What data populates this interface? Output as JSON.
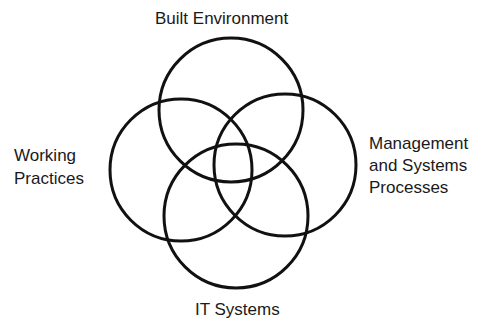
{
  "diagram": {
    "title": "",
    "stroke_color": "#111111",
    "background": "#ffffff",
    "circles": [
      {
        "id": "built-environment",
        "label_lines": [
          "Built Environment"
        ],
        "cx": 231,
        "cy": 110,
        "r": 72
      },
      {
        "id": "working-practices",
        "label_lines": [
          "Working",
          "Practices"
        ],
        "cx": 181,
        "cy": 170,
        "r": 71
      },
      {
        "id": "management-systems-processes",
        "label_lines": [
          "Management",
          "and Systems",
          "Processes"
        ],
        "cx": 285,
        "cy": 165,
        "r": 71
      },
      {
        "id": "it-systems",
        "label_lines": [
          "IT Systems"
        ],
        "cx": 236,
        "cy": 216,
        "r": 72
      }
    ]
  }
}
